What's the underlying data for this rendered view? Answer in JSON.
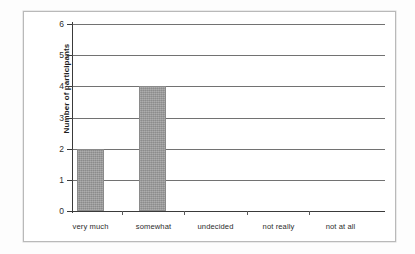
{
  "chart_data": {
    "type": "bar",
    "title": "",
    "xlabel": "",
    "ylabel": "Number of participants",
    "categories": [
      "very much",
      "somewhat",
      "undecided",
      "not really",
      "not at all"
    ],
    "values": [
      2,
      4,
      0,
      0,
      0
    ],
    "ylim": [
      0,
      6
    ],
    "ytick_labels": [
      "0",
      "1",
      "2",
      "3",
      "4",
      "5",
      "6"
    ],
    "ytick_values": [
      0,
      1,
      2,
      3,
      4,
      5,
      6
    ],
    "grid": true,
    "legend": false,
    "legend_position": "none",
    "bar_color": "#9c9c9c",
    "axis_color": "#3a3a3a",
    "gridline_color": "#4a4a4a",
    "frame_color": "#b9b9b9",
    "background": "#ffffff"
  }
}
